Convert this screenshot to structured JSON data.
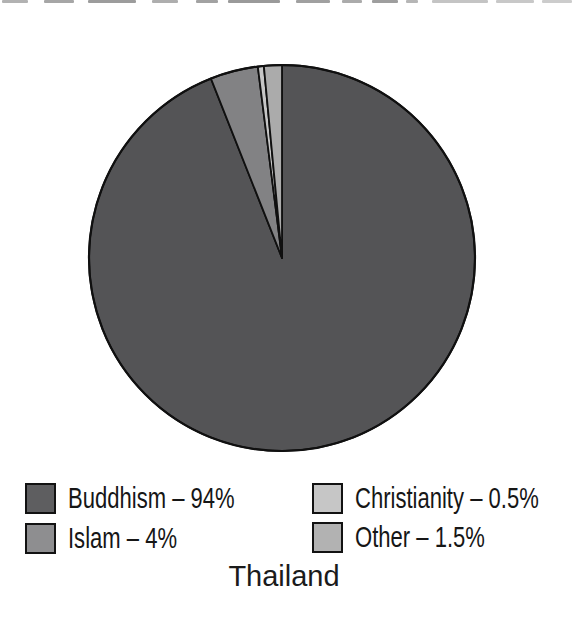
{
  "canvas": {
    "width": 579,
    "height": 622,
    "background": "#ffffff"
  },
  "scan_artifact": {
    "description": "bottom sliver of cropped text line from book scan",
    "segments": [
      {
        "x": 2,
        "w": 26,
        "color": "#b2b2b2"
      },
      {
        "x": 44,
        "w": 30,
        "color": "#a6a6a6"
      },
      {
        "x": 88,
        "w": 48,
        "color": "#9c9c9c"
      },
      {
        "x": 152,
        "w": 26,
        "color": "#aeaeae"
      },
      {
        "x": 196,
        "w": 22,
        "color": "#a2a2a2"
      },
      {
        "x": 228,
        "w": 52,
        "color": "#9a9a9a"
      },
      {
        "x": 296,
        "w": 34,
        "color": "#a0a0a0"
      },
      {
        "x": 342,
        "w": 20,
        "color": "#ababab"
      },
      {
        "x": 372,
        "w": 26,
        "color": "#9e9e9e"
      },
      {
        "x": 406,
        "w": 12,
        "color": "#b6b6b6"
      },
      {
        "x": 432,
        "w": 56,
        "color": "#c4c4c4"
      },
      {
        "x": 496,
        "w": 38,
        "color": "#c8c8c8"
      },
      {
        "x": 542,
        "w": 30,
        "color": "#cccccc"
      }
    ]
  },
  "chart_data": {
    "type": "pie",
    "title": "Thailand",
    "unit": "%",
    "center": {
      "x": 282,
      "y": 258
    },
    "radius": 193,
    "start_angle_deg": 0,
    "direction": "clockwise",
    "outline_color": "#101010",
    "outline_width": 1.8,
    "rim_width": 2.2,
    "slices": [
      {
        "label": "Buddhism",
        "value": 94,
        "display": "Buddhism – 94%",
        "color": "#545456",
        "legend_color": "#5e5e60"
      },
      {
        "label": "Islam",
        "value": 4,
        "display": "Islam – 4%",
        "color": "#828284",
        "legend_color": "#8e8e90"
      },
      {
        "label": "Christianity",
        "value": 0.5,
        "display": "Christianity – 0.5%",
        "color": "#c6c6c6",
        "legend_color": "#c6c6c6"
      },
      {
        "label": "Other",
        "value": 1.5,
        "display": "Other – 1.5%",
        "color": "#ababab",
        "legend_color": "#b2b2b2"
      }
    ],
    "legend": {
      "position": "bottom",
      "columns": 2,
      "rows": [
        {
          "col": 1,
          "row": 1,
          "slice_index": 0,
          "x": 25,
          "y": 482
        },
        {
          "col": 1,
          "row": 2,
          "slice_index": 1,
          "x": 25,
          "y": 522
        },
        {
          "col": 2,
          "row": 1,
          "slice_index": 2,
          "x": 312,
          "y": 482
        },
        {
          "col": 2,
          "row": 2,
          "slice_index": 3,
          "x": 312,
          "y": 521
        }
      ]
    }
  }
}
